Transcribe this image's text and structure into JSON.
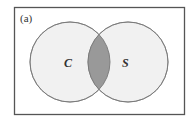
{
  "diagram": {
    "type": "venn",
    "panel_label": "(a)",
    "sets": [
      {
        "label": "C",
        "fill": "#f1f1f1"
      },
      {
        "label": "S",
        "fill": "#f1f1f1"
      }
    ],
    "intersection": {
      "fill": "#999999",
      "shaded": true
    },
    "frame_color": "#555555",
    "circle_stroke": "#888888"
  }
}
